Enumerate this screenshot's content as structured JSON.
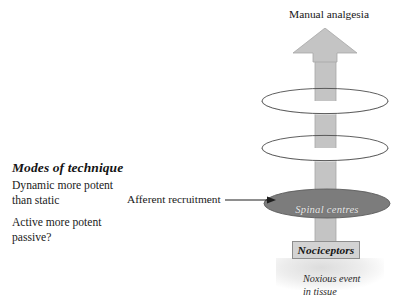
{
  "diagram": {
    "title_top": "Manual analgesia",
    "modes": {
      "heading": "Modes of technique",
      "line_1": "Dynamic more potent than static",
      "line_2": "Active more potent passive?"
    },
    "afferent": {
      "label": "Afferent recruitment",
      "arrow_icon": "right-arrow-icon"
    },
    "nodes": {
      "spinal_centres": "Spinal centres",
      "nociceptors": "Nociceptors"
    },
    "caption": {
      "line_1": "Noxious event",
      "line_2": "in tissue"
    },
    "icons": {
      "up_block_arrow": "up-block-arrow-icon",
      "ellipse_upper": "ellipse-outline-icon",
      "ellipse_lower": "ellipse-outline-icon",
      "spinal_ellipse": "filled-ellipse-icon"
    },
    "colors": {
      "arrow_fill": "#c4c4c4",
      "arrow_stroke": "#a0a0a0",
      "ellipse_stroke": "#4a4a4a",
      "ellipse_fill": "#ffffff",
      "spinal_fill": "#7c7c7c",
      "spinal_stroke": "#5e5e5e",
      "box_fill": "#d3d3d3",
      "box_stroke": "#8e8e8e",
      "text": "#1a1a1a",
      "spinal_text": "#e9e9e9",
      "background": "#ffffff"
    }
  }
}
